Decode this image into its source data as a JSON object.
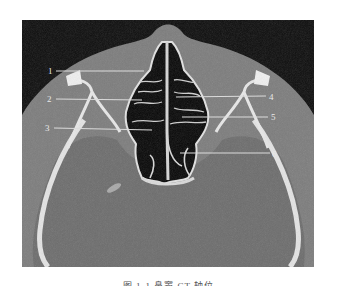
{
  "figure": {
    "type": "axial CT scan of paranasal sinuses / orbits",
    "labels": [
      {
        "number": "1",
        "side": "left"
      },
      {
        "number": "2",
        "side": "left"
      },
      {
        "number": "3",
        "side": "left"
      },
      {
        "number": "4",
        "side": "right"
      },
      {
        "number": "5",
        "side": "right"
      },
      {
        "number": "6",
        "side": "right"
      }
    ],
    "colors": {
      "background_air": "#0c0c0c",
      "soft_tissue": "#7a7a7a",
      "brain": "#6e6e6e",
      "bone": "#e6e6e6",
      "leader_line": "#dcdcdc"
    }
  },
  "caption": {
    "text": "图 1-1  鼻窦 CT 轴位"
  }
}
